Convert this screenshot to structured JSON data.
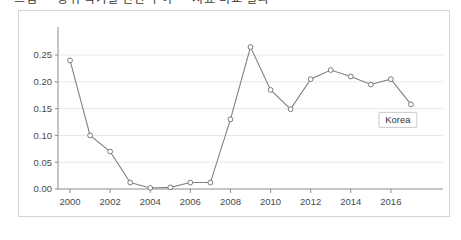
{
  "top_cropped_text": "그림  —  상위 국가별 연간 추이  —  지표 비교 결과",
  "chart_data": {
    "type": "line",
    "title": "",
    "subtitle": "",
    "xlabel": "",
    "ylabel": "",
    "x": [
      2000,
      2001,
      2002,
      2003,
      2004,
      2005,
      2006,
      2007,
      2008,
      2009,
      2010,
      2011,
      2012,
      2013,
      2014,
      2015,
      2016,
      2017
    ],
    "series": [
      {
        "name": "Korea",
        "values": [
          0.24,
          0.1,
          0.07,
          0.012,
          0.002,
          0.003,
          0.012,
          0.012,
          0.13,
          0.265,
          0.185,
          0.149,
          0.205,
          0.222,
          0.21,
          0.195,
          0.205,
          0.158
        ]
      }
    ],
    "annotations": [
      {
        "label": "Korea",
        "x": 2017,
        "y": 0.158
      }
    ],
    "x_ticks": [
      "2000",
      "2002",
      "2004",
      "2006",
      "2008",
      "2010",
      "2012",
      "2014",
      "2016"
    ],
    "x_tick_values": [
      2000,
      2002,
      2004,
      2006,
      2008,
      2010,
      2012,
      2014,
      2016
    ],
    "y_ticks": [
      "0.00",
      "0.05",
      "0.10",
      "0.15",
      "0.20",
      "0.25"
    ],
    "y_tick_values": [
      0.0,
      0.05,
      0.1,
      0.15,
      0.2,
      0.25
    ],
    "xlim": [
      1999.4,
      2018.6
    ],
    "ylim": [
      0,
      0.28
    ],
    "grid": true,
    "grid_axis": "y",
    "legend": "none",
    "line_color": "#808080",
    "marker_color": "#ffffff",
    "marker_edge_color": "#7a7a7a",
    "grid_color": "#e8e8e8",
    "axis_color": "#8c8c8c",
    "frame_color": "#d6d6d6",
    "background": "#ffffff"
  }
}
